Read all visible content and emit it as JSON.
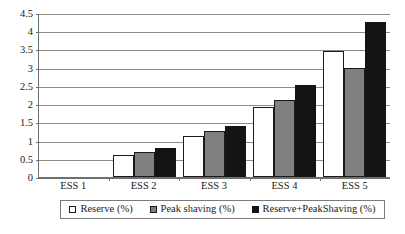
{
  "chart_data": {
    "type": "bar",
    "title": "",
    "subtitle": "",
    "xlabel": "",
    "ylabel": "",
    "categories": [
      "ESS 1",
      "ESS 2",
      "ESS 3",
      "ESS 4",
      "ESS 5"
    ],
    "series": [
      {
        "name": "Reserve (%)",
        "color": "#ffffff",
        "values": [
          0,
          0.6,
          1.12,
          1.93,
          3.47
        ]
      },
      {
        "name": "Peak shaving (%)",
        "color": "#808080",
        "values": [
          0,
          0.7,
          1.25,
          2.1,
          3.0
        ]
      },
      {
        "name": "Reserve+PeakShaving (%)",
        "color": "#141414",
        "values": [
          0,
          0.8,
          1.4,
          2.53,
          4.25
        ]
      }
    ],
    "ylim": [
      0,
      4.5
    ],
    "yticks": [
      0,
      0.5,
      1,
      1.5,
      2,
      2.5,
      3,
      3.5,
      4,
      4.5
    ],
    "ytick_labels": [
      "0",
      "0.5",
      "1",
      "1.5",
      "2",
      "2.5",
      "3",
      "3.5",
      "4",
      "4.5"
    ],
    "grid": "horizontal",
    "legend_position": "bottom",
    "legend_border": true
  },
  "legend": {
    "entries": [
      {
        "label": "Reserve (%)",
        "swatch": "white-square-icon"
      },
      {
        "label": "Peak shaving (%)",
        "swatch": "gray-square-icon"
      },
      {
        "label": "Reserve+PeakShaving (%)",
        "swatch": "black-square-icon"
      }
    ]
  },
  "axes": {
    "y_tick_labels": [
      "4.5",
      "4",
      "3.5",
      "3",
      "2.5",
      "2",
      "1.5",
      "1",
      "0.5",
      "0"
    ],
    "x_tick_labels": [
      "ESS 1",
      "ESS 2",
      "ESS 3",
      "ESS 4",
      "ESS 5"
    ]
  }
}
